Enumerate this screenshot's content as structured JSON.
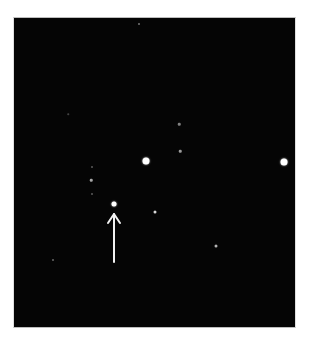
{
  "image": {
    "description": "Astronomical star field photograph with an arrow pointing to a target star",
    "background_color": "#050505",
    "frame": {
      "x": 13,
      "y": 17,
      "width": 283,
      "height": 311
    },
    "stars": [
      {
        "x": 114,
        "y": 204,
        "size": 5,
        "brightness": 1.0,
        "target": true
      },
      {
        "x": 146,
        "y": 161,
        "size": 7,
        "brightness": 1.0
      },
      {
        "x": 284,
        "y": 162,
        "size": 7,
        "brightness": 1.0
      },
      {
        "x": 155,
        "y": 212,
        "size": 3,
        "brightness": 0.85
      },
      {
        "x": 216,
        "y": 246,
        "size": 3,
        "brightness": 0.7
      },
      {
        "x": 180,
        "y": 151,
        "size": 2.5,
        "brightness": 0.6
      },
      {
        "x": 179,
        "y": 124,
        "size": 2.5,
        "brightness": 0.5
      },
      {
        "x": 91,
        "y": 180,
        "size": 2.5,
        "brightness": 0.65
      },
      {
        "x": 92,
        "y": 167,
        "size": 2,
        "brightness": 0.35
      },
      {
        "x": 92,
        "y": 194,
        "size": 2,
        "brightness": 0.35
      },
      {
        "x": 53,
        "y": 260,
        "size": 2,
        "brightness": 0.4
      },
      {
        "x": 139,
        "y": 24,
        "size": 2,
        "brightness": 0.45
      },
      {
        "x": 68,
        "y": 114,
        "size": 1.5,
        "brightness": 0.25
      }
    ],
    "arrow": {
      "color": "#f2f2f2",
      "tip": {
        "x": 114,
        "y": 214
      },
      "tail": {
        "x": 114,
        "y": 262
      },
      "points_to": "target star"
    }
  }
}
